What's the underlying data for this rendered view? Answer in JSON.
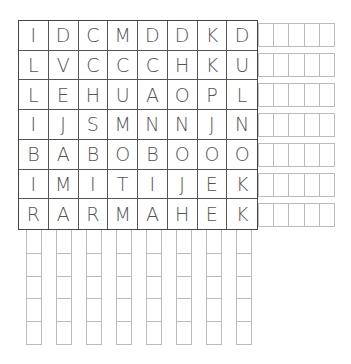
{
  "puzzle": {
    "type": "word-search",
    "rows": [
      [
        "I",
        "D",
        "C",
        "M",
        "D",
        "D",
        "K",
        "D"
      ],
      [
        "L",
        "V",
        "C",
        "C",
        "C",
        "H",
        "K",
        "U"
      ],
      [
        "L",
        "E",
        "H",
        "U",
        "A",
        "O",
        "P",
        "L"
      ],
      [
        "I",
        "J",
        "S",
        "M",
        "N",
        "N",
        "J",
        "N"
      ],
      [
        "B",
        "A",
        "B",
        "O",
        "B",
        "O",
        "O",
        "O"
      ],
      [
        "I",
        "M",
        "I",
        "T",
        "I",
        "J",
        "E",
        "K"
      ],
      [
        "R",
        "A",
        "R",
        "M",
        "A",
        "H",
        "E",
        "K"
      ]
    ],
    "row_answer_slots": 5,
    "column_answer_slots": 5
  },
  "colors": {
    "grid_border": "#444444",
    "letter": "#555555",
    "answer_box": "#bbbbbb"
  }
}
